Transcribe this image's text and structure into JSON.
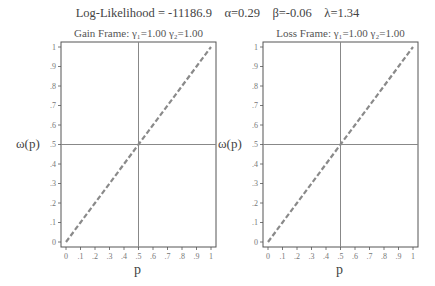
{
  "header": {
    "title": "Log-Likelihood = -11186.9    α=0.29    β=-0.06    λ=1.34",
    "log_likelihood": -11186.9,
    "alpha": 0.29,
    "beta": -0.06,
    "lambda": 1.34
  },
  "panels": [
    {
      "title": "Gain Frame: γ₁=1.00 γ₂=1.00",
      "ylabel": "ω(p)",
      "xlabel": "p"
    },
    {
      "title": "Loss Frame: γ₁=1.00 γ₂=1.00",
      "ylabel": "ω(p)",
      "xlabel": "p"
    }
  ],
  "colors": {
    "frame": "#555555",
    "reference_lines": "#888888",
    "curve": "#8a8a8a"
  },
  "chart_data": [
    {
      "type": "line",
      "title": "Gain Frame: γ₁=1.00 γ₂=1.00",
      "suptitle": "Log-Likelihood = -11186.9  α=0.29  β=-0.06  λ=1.34",
      "xlabel": "p",
      "ylabel": "ω(p)",
      "xlim": [
        0,
        1
      ],
      "ylim": [
        0,
        1
      ],
      "xticks": [
        "0",
        ".1",
        ".2",
        ".3",
        ".4",
        ".5",
        ".6",
        ".7",
        ".8",
        ".9",
        "1"
      ],
      "yticks": [
        "0",
        ".1",
        ".2",
        ".3",
        ".4",
        ".5",
        ".6",
        ".7",
        ".8",
        ".9",
        "1"
      ],
      "reference_lines": {
        "vertical": 0.5,
        "horizontal": 0.5
      },
      "series": [
        {
          "name": "ω(p)",
          "style": "dashed",
          "x": [
            0,
            0.1,
            0.2,
            0.3,
            0.4,
            0.5,
            0.6,
            0.7,
            0.8,
            0.9,
            1.0
          ],
          "y": [
            0,
            0.1,
            0.2,
            0.3,
            0.4,
            0.5,
            0.6,
            0.7,
            0.8,
            0.9,
            1.0
          ]
        }
      ],
      "grid": false
    },
    {
      "type": "line",
      "title": "Loss Frame: γ₁=1.00 γ₂=1.00",
      "xlabel": "p",
      "ylabel": "ω(p)",
      "xlim": [
        0,
        1
      ],
      "ylim": [
        0,
        1
      ],
      "xticks": [
        "0",
        ".1",
        ".2",
        ".3",
        ".4",
        ".5",
        ".6",
        ".7",
        ".8",
        ".9",
        "1"
      ],
      "yticks": [
        "0",
        ".1",
        ".2",
        ".3",
        ".4",
        ".5",
        ".6",
        ".7",
        ".8",
        ".9",
        "1"
      ],
      "reference_lines": {
        "vertical": 0.5,
        "horizontal": 0.5
      },
      "series": [
        {
          "name": "ω(p)",
          "style": "dashed",
          "x": [
            0,
            0.1,
            0.2,
            0.3,
            0.4,
            0.5,
            0.6,
            0.7,
            0.8,
            0.9,
            1.0
          ],
          "y": [
            0,
            0.1,
            0.2,
            0.3,
            0.4,
            0.5,
            0.6,
            0.7,
            0.8,
            0.9,
            1.0
          ]
        }
      ],
      "grid": false
    }
  ]
}
